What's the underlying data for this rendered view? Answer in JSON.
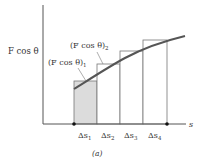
{
  "figure": {
    "y_axis_label": "F cos θ",
    "x_axis_label": "s",
    "caption": "(a)",
    "annotations": [
      {
        "text": "(F cos θ)",
        "subscript": "1"
      },
      {
        "text": "(F cos θ)",
        "subscript": "2"
      }
    ],
    "intervals": [
      {
        "label": "Δs",
        "subscript": "1",
        "shaded": true
      },
      {
        "label": "Δs",
        "subscript": "2",
        "shaded": false
      },
      {
        "label": "Δs",
        "subscript": "3",
        "shaded": false
      },
      {
        "label": "Δs",
        "subscript": "4",
        "shaded": false
      }
    ],
    "colors": {
      "curve": "#555555",
      "axis": "#555555",
      "bar_outline": "#777777",
      "shaded_fill": "#dcdcdc",
      "text": "#333333"
    }
  }
}
